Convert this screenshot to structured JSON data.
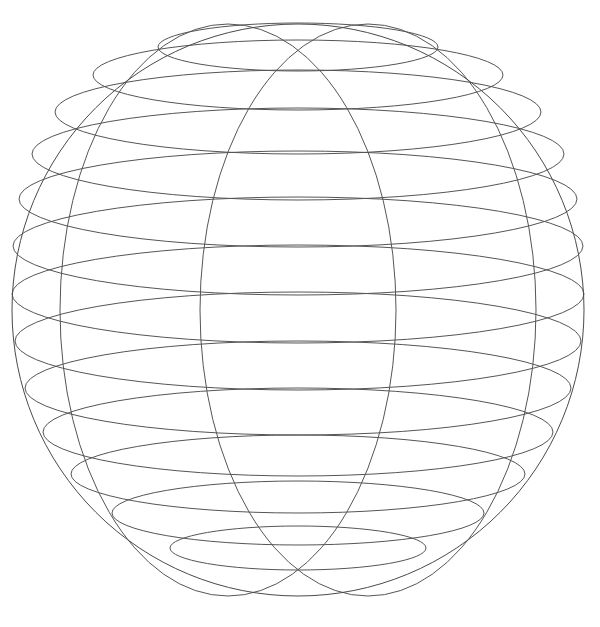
{
  "figure": {
    "kind": "line-drawing",
    "background_color": "#ffffff",
    "stroke_color": "#555555",
    "stroke_width": 1,
    "canvas": {
      "width": 600,
      "height": 627
    }
  },
  "chart_data": {
    "type": "line",
    "subtitle": "",
    "xlabel": "",
    "ylabel": "",
    "grid": false,
    "legend": "none",
    "projection": "orthographic",
    "sphere": {
      "center_x": 298,
      "center_y": 310,
      "radius": 286,
      "outline_color": "#4a4a4a"
    },
    "latitude_circles": {
      "count": 13,
      "note": "horizontal small-circles of the sphere rendered as ellipses; cy = vertical screen position, rx/ry = ellipse semi-axes",
      "items": [
        {
          "name": "lat-1",
          "cy": 47,
          "rx": 140,
          "ry": 24
        },
        {
          "name": "lat-2",
          "cy": 75,
          "rx": 205,
          "ry": 35
        },
        {
          "name": "lat-3",
          "cy": 112,
          "rx": 243,
          "ry": 42
        },
        {
          "name": "lat-4",
          "cy": 154,
          "rx": 266,
          "ry": 46
        },
        {
          "name": "lat-5",
          "cy": 199,
          "rx": 279,
          "ry": 48
        },
        {
          "name": "lat-6",
          "cy": 246,
          "rx": 285,
          "ry": 49
        },
        {
          "name": "lat-7",
          "cy": 294,
          "rx": 286,
          "ry": 49
        },
        {
          "name": "lat-8",
          "cy": 341,
          "rx": 283,
          "ry": 49
        },
        {
          "name": "lat-9",
          "cy": 388,
          "rx": 273,
          "ry": 47
        },
        {
          "name": "lat-10",
          "cy": 432,
          "rx": 255,
          "ry": 44
        },
        {
          "name": "lat-11",
          "cy": 474,
          "rx": 227,
          "ry": 39
        },
        {
          "name": "lat-12",
          "cy": 513,
          "rx": 186,
          "ry": 32
        },
        {
          "name": "lat-13",
          "cy": 548,
          "rx": 128,
          "ry": 22
        }
      ]
    },
    "meridian_circles": {
      "count": 2,
      "note": "great-circle meridians seen nearly edge-on, rendered as narrow ellipses sharing the sphere centre",
      "items": [
        {
          "name": "meridian-left",
          "cx": 228,
          "cy": 310,
          "rx": 168,
          "ry": 286,
          "rotation": 0
        },
        {
          "name": "meridian-right",
          "cx": 368,
          "cy": 310,
          "rx": 168,
          "ry": 286,
          "rotation": 0
        }
      ]
    },
    "x": [],
    "values": []
  }
}
